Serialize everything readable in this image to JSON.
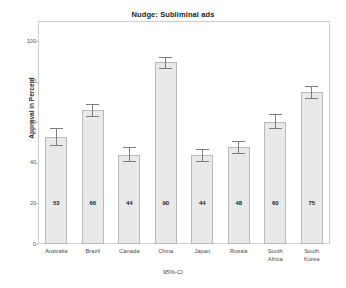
{
  "chart_data": {
    "type": "bar",
    "title": "Nudge: Subliminal ads",
    "xlabel": "95%-CI",
    "ylabel": "Approval in Percent",
    "categories": [
      "Australia",
      "Brazil",
      "Canada",
      "China",
      "Japan",
      "Russia",
      "South Africa",
      "South Korea"
    ],
    "values": [
      53,
      66,
      44,
      90,
      44,
      48,
      60,
      75
    ],
    "data_labels": [
      "53",
      "66",
      "44",
      "90",
      "44",
      "48",
      "60",
      "75"
    ],
    "error_low": [
      49,
      63,
      41,
      87,
      41,
      45,
      57,
      72
    ],
    "error_high": [
      57,
      69,
      48,
      92,
      47,
      51,
      64,
      78
    ],
    "ylim": [
      0,
      110
    ],
    "yticks": [
      0,
      20,
      40,
      60,
      80,
      100
    ],
    "ytick_labels": [
      "0",
      "20",
      "40",
      "60",
      "80",
      "100"
    ],
    "grid": false,
    "legend": "none",
    "bar_color": "#e9e9e9",
    "bar_edge_color": "#b9b9b9",
    "error_color": "#7d7d7d",
    "frame_color": "#cfcfcf",
    "background": "#ffffff"
  }
}
